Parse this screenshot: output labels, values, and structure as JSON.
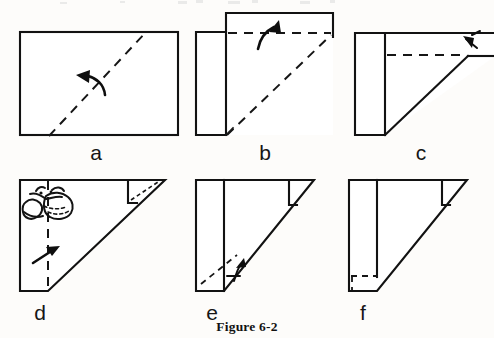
{
  "figure": {
    "caption": "Figure 6-2",
    "type": "instructional-diagram",
    "background_color": "#fdfcfa",
    "ink_color": "#121212",
    "panel_count": 6
  },
  "panels": [
    {
      "id": "a",
      "label": "a",
      "label_x": 96,
      "label_y": 160,
      "description": "Full rectangle of paper with a dashed diagonal valley-fold line running from lower-left to upper-right, and a curved arrow pointing up and to the left indicating the fold direction.",
      "shape": "rectangle",
      "solid_edges": 4,
      "dashed_lines": 1,
      "arrows": 1,
      "arrow_direction": "up-left"
    },
    {
      "id": "b",
      "label": "b",
      "label_x": 265,
      "label_y": 160,
      "description": "Paper after the first diagonal fold: a narrow vertical panel at left with a wide horizontal band raised at the upper right. A dashed horizontal fold line crosses the band and a dashed diagonal runs to the lower left. A curved arrow points up and to the right.",
      "shape": "L-shape",
      "solid_edges": 8,
      "dashed_lines": 2,
      "arrows": 1,
      "arrow_direction": "up-right"
    },
    {
      "id": "c",
      "label": "c",
      "label_x": 421,
      "label_y": 160,
      "description": "Narrow vertical panel at left joined to a long tapering triangular flap extending past the right edge of the frame. A dashed horizontal fold line runs to the apex of the diagonal. A small arrowhead at upper right points back up and to the left.",
      "shape": "triangle-with-panel",
      "solid_edges": 6,
      "dashed_lines": 1,
      "arrows": 1,
      "arrow_direction": "up-left",
      "note": "shape runs off the right edge of the image"
    },
    {
      "id": "d",
      "label": "d",
      "label_x": 40,
      "label_y": 320,
      "description": "Triangular folded form with a vertical dashed fold line near the left, a small folded corner flap at the upper right, a hand-drawn scribble annotation in the upper left area, and a straight arrow pointing up and to the right.",
      "shape": "right-triangle-with-panel",
      "solid_edges": 5,
      "dashed_lines": 2,
      "arrows": 1,
      "arrow_direction": "up-right",
      "annotation": "hand-drawn scribble / doodle"
    },
    {
      "id": "e",
      "label": "e",
      "label_x": 212,
      "label_y": 320,
      "description": "Right triangle with a vertical crease line and a small triangular flap folded at the top right corner. A dashed diagonal fold line appears at the lower left with a small curved arrow indicating the tuck.",
      "shape": "right-triangle-with-panel",
      "solid_edges": 6,
      "dashed_lines": 1,
      "arrows": 1,
      "arrow_direction": "up"
    },
    {
      "id": "f",
      "label": "f",
      "label_x": 363,
      "label_y": 320,
      "description": "Finished right triangle with a vertical crease line, the small triangular flap at the top right corner, and a dashed small triangle showing the tucked corner at the bottom left.",
      "shape": "right-triangle-with-panel",
      "solid_edges": 6,
      "dashed_lines": 2,
      "arrows": 0
    }
  ]
}
